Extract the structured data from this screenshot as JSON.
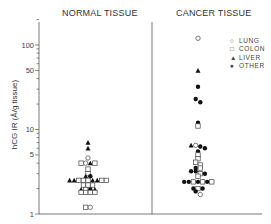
{
  "chart_data": {
    "type": "scatter",
    "title": "",
    "panels": [
      {
        "name": "NORMAL TISSUE",
        "points": [
          {
            "type": "LIVER",
            "value": 7.0
          },
          {
            "type": "LIVER",
            "value": 6.0
          },
          {
            "type": "LUNG",
            "value": 4.6
          },
          {
            "type": "COLON",
            "value": 4.0
          },
          {
            "type": "LUNG",
            "value": 4.0
          },
          {
            "type": "LIVER",
            "value": 4.0
          },
          {
            "type": "COLON",
            "value": 4.0
          },
          {
            "type": "COLON",
            "value": 3.4
          },
          {
            "type": "COLON",
            "value": 3.0
          },
          {
            "type": "LIVER",
            "value": 2.8
          },
          {
            "type": "OTHER",
            "value": 2.8
          },
          {
            "type": "LIVER",
            "value": 2.5
          },
          {
            "type": "LIVER",
            "value": 2.5
          },
          {
            "type": "COLON",
            "value": 2.5
          },
          {
            "type": "COLON",
            "value": 2.5
          },
          {
            "type": "COLON",
            "value": 2.5
          },
          {
            "type": "LIVER",
            "value": 2.5
          },
          {
            "type": "LIVER",
            "value": 2.5
          },
          {
            "type": "COLON",
            "value": 2.5
          },
          {
            "type": "COLON",
            "value": 2.5
          },
          {
            "type": "COLON",
            "value": 2.2
          },
          {
            "type": "COLON",
            "value": 2.2
          },
          {
            "type": "COLON",
            "value": 2.2
          },
          {
            "type": "LIVER",
            "value": 1.95
          },
          {
            "type": "COLON",
            "value": 1.95
          },
          {
            "type": "OTHER",
            "value": 1.95
          },
          {
            "type": "LIVER",
            "value": 1.95
          },
          {
            "type": "COLON",
            "value": 1.8
          },
          {
            "type": "COLON",
            "value": 1.8
          },
          {
            "type": "COLON",
            "value": 1.8
          },
          {
            "type": "COLON",
            "value": 1.8
          },
          {
            "type": "COLON",
            "value": 1.2
          },
          {
            "type": "LUNG",
            "value": 1.2
          }
        ]
      },
      {
        "name": "CANCER TISSUE",
        "points": [
          {
            "type": "LUNG",
            "value": 120
          },
          {
            "type": "LIVER",
            "value": 50
          },
          {
            "type": "OTHER",
            "value": 32
          },
          {
            "type": "OTHER",
            "value": 23
          },
          {
            "type": "OTHER",
            "value": 21
          },
          {
            "type": "OTHER",
            "value": 12
          },
          {
            "type": "COLON",
            "value": 11
          },
          {
            "type": "LIVER",
            "value": 6.5
          },
          {
            "type": "LUNG",
            "value": 6.5
          },
          {
            "type": "OTHER",
            "value": 6.3
          },
          {
            "type": "OTHER",
            "value": 6.0
          },
          {
            "type": "OTHER",
            "value": 5.5
          },
          {
            "type": "COLON",
            "value": 5.0
          },
          {
            "type": "COLON",
            "value": 4.5
          },
          {
            "type": "COLON",
            "value": 4.1
          },
          {
            "type": "COLON",
            "value": 3.8
          },
          {
            "type": "OTHER",
            "value": 3.5
          },
          {
            "type": "COLON",
            "value": 3.5
          },
          {
            "type": "OTHER",
            "value": 3.2
          },
          {
            "type": "OTHER",
            "value": 3.2
          },
          {
            "type": "COLON",
            "value": 3.0
          },
          {
            "type": "OTHER",
            "value": 3.0
          },
          {
            "type": "COLON",
            "value": 2.8
          },
          {
            "type": "OTHER",
            "value": 2.4
          },
          {
            "type": "OTHER",
            "value": 2.4
          },
          {
            "type": "COLON",
            "value": 2.4
          },
          {
            "type": "OTHER",
            "value": 2.4
          },
          {
            "type": "COLON",
            "value": 2.4
          },
          {
            "type": "OTHER",
            "value": 2.4
          },
          {
            "type": "COLON",
            "value": 2.4
          },
          {
            "type": "OTHER",
            "value": 2.0
          },
          {
            "type": "COLON",
            "value": 2.0
          },
          {
            "type": "OTHER",
            "value": 2.0
          },
          {
            "type": "OTHER",
            "value": 1.85
          },
          {
            "type": "LUNG",
            "value": 1.7
          }
        ]
      }
    ],
    "xlabel": "",
    "ylabel": "hCG IR (Å/g tissue)",
    "yscale": "log",
    "ylim": [
      1,
      200
    ],
    "yticks": [
      1,
      5,
      10,
      50,
      100
    ],
    "legend": [
      "LUNG",
      "COLON",
      "LIVER",
      "OTHER"
    ],
    "legend_position": "upper right",
    "grid": false
  },
  "panels": {
    "left_title": "NORMAL TISSUE",
    "right_title": "CANCER TISSUE"
  },
  "axis": {
    "ylabel": "hCG IR (Å/g tissue)",
    "ticks": [
      {
        "label": "100",
        "value": 100
      },
      {
        "label": "50",
        "value": 50
      },
      {
        "label": "10",
        "value": 10
      },
      {
        "label": "5",
        "value": 5
      },
      {
        "label": "1",
        "value": 1
      }
    ]
  },
  "legend": {
    "items": [
      {
        "symbol": "○",
        "label": "LUNG"
      },
      {
        "symbol": "□",
        "label": "COLON"
      },
      {
        "symbol": "▲",
        "label": "LIVER"
      },
      {
        "symbol": "●",
        "label": "OTHER"
      }
    ]
  }
}
